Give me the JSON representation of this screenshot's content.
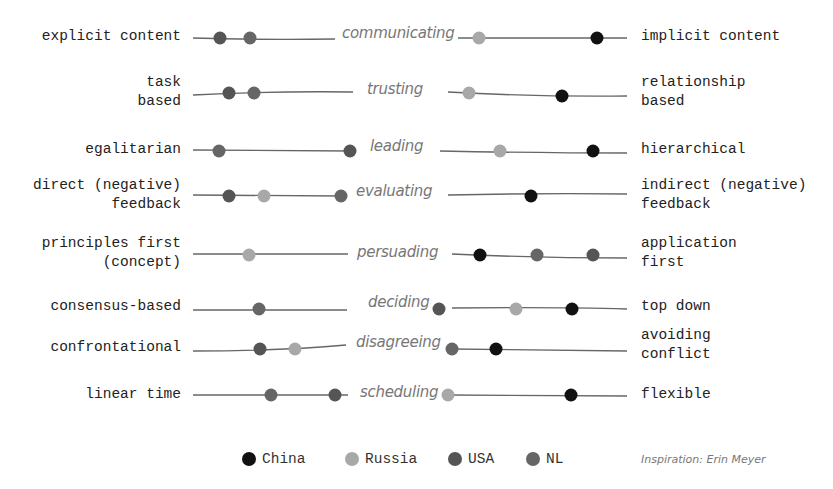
{
  "chart_data": {
    "type": "scatter",
    "xlabel": "",
    "ylabel": "",
    "xlim": [
      0,
      100
    ],
    "grid": false,
    "legend_position": "bottom",
    "colors": {
      "China": "#111111",
      "Russia": "#a8a8a8",
      "USA": "#555555",
      "NL": "#666666"
    },
    "legend": [
      "China",
      "Russia",
      "USA",
      "NL"
    ],
    "credit": "Inspiration: Erin Meyer",
    "dimensions": [
      {
        "name": "communicating",
        "left": "explicit content",
        "right": "implicit content",
        "points": [
          {
            "country": "USA",
            "x": 220
          },
          {
            "country": "NL",
            "x": 250
          },
          {
            "country": "Russia",
            "x": 479
          },
          {
            "country": "China",
            "x": 597
          }
        ]
      },
      {
        "name": "trusting",
        "left": "task\nbased",
        "right": "relationship\nbased",
        "points": [
          {
            "country": "USA",
            "x": 229
          },
          {
            "country": "NL",
            "x": 254
          },
          {
            "country": "Russia",
            "x": 469
          },
          {
            "country": "China",
            "x": 562
          }
        ]
      },
      {
        "name": "leading",
        "left": "egalitarian",
        "right": "hierarchical",
        "points": [
          {
            "country": "NL",
            "x": 219
          },
          {
            "country": "USA",
            "x": 350
          },
          {
            "country": "Russia",
            "x": 500
          },
          {
            "country": "China",
            "x": 593
          }
        ]
      },
      {
        "name": "evaluating",
        "left": "direct (negative)\nfeedback",
        "right": "indirect (negative)\nfeedback",
        "points": [
          {
            "country": "USA",
            "x": 229
          },
          {
            "country": "Russia",
            "x": 264
          },
          {
            "country": "NL",
            "x": 341
          },
          {
            "country": "China",
            "x": 531
          }
        ]
      },
      {
        "name": "persuading",
        "left": "principles first\n(concept)",
        "right": "application\nfirst",
        "points": [
          {
            "country": "Russia",
            "x": 249
          },
          {
            "country": "China",
            "x": 480
          },
          {
            "country": "NL",
            "x": 537
          },
          {
            "country": "USA",
            "x": 593
          }
        ]
      },
      {
        "name": "deciding",
        "left": "consensus-based",
        "right": "top down",
        "points": [
          {
            "country": "NL",
            "x": 259
          },
          {
            "country": "USA",
            "x": 439
          },
          {
            "country": "Russia",
            "x": 516
          },
          {
            "country": "China",
            "x": 572
          }
        ]
      },
      {
        "name": "disagreeing",
        "left": "confrontational",
        "right": "avoiding\nconflict",
        "points": [
          {
            "country": "USA",
            "x": 260
          },
          {
            "country": "Russia",
            "x": 295
          },
          {
            "country": "NL",
            "x": 452
          },
          {
            "country": "China",
            "x": 496
          }
        ]
      },
      {
        "name": "scheduling",
        "left": "linear time",
        "right": "flexible",
        "points": [
          {
            "country": "NL",
            "x": 271
          },
          {
            "country": "USA",
            "x": 335
          },
          {
            "country": "Russia",
            "x": 448
          },
          {
            "country": "China",
            "x": 571
          }
        ]
      }
    ]
  },
  "rows": [
    {
      "left": "explicit content",
      "right": "implicit content",
      "dimension": "communicating"
    },
    {
      "left": "task\nbased",
      "right": "relationship\nbased",
      "dimension": "trusting"
    },
    {
      "left": "egalitarian",
      "right": "hierarchical",
      "dimension": "leading"
    },
    {
      "left": "direct (negative)\nfeedback",
      "right": "indirect (negative)\nfeedback",
      "dimension": "evaluating"
    },
    {
      "left": "principles first\n(concept)",
      "right": "application\nfirst",
      "dimension": "persuading"
    },
    {
      "left": "consensus-based",
      "right": "top down",
      "dimension": "deciding"
    },
    {
      "left": "confrontational",
      "right": "avoiding\nconflict",
      "dimension": "disagreeing"
    },
    {
      "left": "linear time",
      "right": "flexible",
      "dimension": "scheduling"
    }
  ],
  "legend": {
    "items": [
      {
        "label": "China",
        "color": "#111111"
      },
      {
        "label": "Russia",
        "color": "#a8a8a8"
      },
      {
        "label": "USA",
        "color": "#555555"
      },
      {
        "label": "NL",
        "color": "#666666"
      }
    ],
    "credit": "Inspiration: Erin Meyer"
  }
}
